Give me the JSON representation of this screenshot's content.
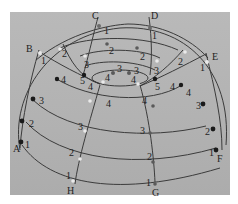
{
  "figure": {
    "type": "photograph of dome wireframe model",
    "background_color": "#b5b5b5",
    "line_color": "#3a3a3a",
    "node_dark_color": "#1a1a1a",
    "node_light_color": "#e8e8e8",
    "corner_labels": {
      "A": "A",
      "B": "B",
      "C": "C",
      "D": "D",
      "E": "E",
      "F": "F",
      "G": "G",
      "H": "H"
    },
    "node_labels": [
      {
        "id": "n-c1",
        "text": "1"
      },
      {
        "id": "n-d1",
        "text": "1"
      },
      {
        "id": "n-b1",
        "text": "1"
      },
      {
        "id": "n-e1",
        "text": "1"
      },
      {
        "id": "n-a1",
        "text": "1"
      },
      {
        "id": "n-f1",
        "text": "1"
      },
      {
        "id": "n-h1",
        "text": "1"
      },
      {
        "id": "n-g1",
        "text": "1"
      },
      {
        "id": "n-2a",
        "text": "2"
      },
      {
        "id": "n-2b",
        "text": "2"
      },
      {
        "id": "n-2c",
        "text": "2"
      },
      {
        "id": "n-2d",
        "text": "2"
      },
      {
        "id": "n-2e",
        "text": "2"
      },
      {
        "id": "n-2f",
        "text": "2"
      },
      {
        "id": "n-2g",
        "text": "2"
      },
      {
        "id": "n-2h",
        "text": "2"
      },
      {
        "id": "n-3a",
        "text": "3"
      },
      {
        "id": "n-3b",
        "text": "3"
      },
      {
        "id": "n-3c",
        "text": "3"
      },
      {
        "id": "n-3d",
        "text": "3"
      },
      {
        "id": "n-3e",
        "text": "3"
      },
      {
        "id": "n-3f",
        "text": "3"
      },
      {
        "id": "n-3g",
        "text": "3"
      },
      {
        "id": "n-3h",
        "text": "3"
      },
      {
        "id": "n-4a",
        "text": "4"
      },
      {
        "id": "n-4b",
        "text": "4"
      },
      {
        "id": "n-4c",
        "text": "4"
      },
      {
        "id": "n-4d",
        "text": "4"
      },
      {
        "id": "n-4e",
        "text": "4"
      },
      {
        "id": "n-4f",
        "text": "4"
      },
      {
        "id": "n-4g",
        "text": "4"
      },
      {
        "id": "n-4h",
        "text": "4"
      },
      {
        "id": "n-5a",
        "text": "5"
      },
      {
        "id": "n-5b",
        "text": "5"
      }
    ]
  }
}
